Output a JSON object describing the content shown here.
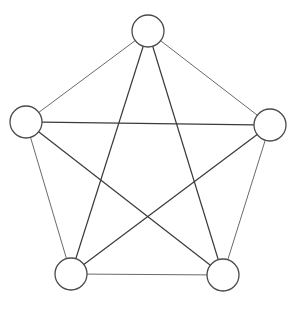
{
  "diagram": {
    "type": "complete-graph",
    "name": "K5",
    "node_radius": 16,
    "colors": {
      "background": "#ffffff",
      "node_stroke": "#4a4a4a",
      "node_fill": "#ffffff",
      "outer_edge": "#6a6a6a",
      "inner_edge": "#3a3a3a"
    },
    "nodes": [
      {
        "id": "top",
        "cx": 148,
        "cy": 31
      },
      {
        "id": "left",
        "cx": 26,
        "cy": 122
      },
      {
        "id": "right",
        "cx": 270,
        "cy": 125
      },
      {
        "id": "bottom-left",
        "cx": 71,
        "cy": 274
      },
      {
        "id": "bottom-right",
        "cx": 223,
        "cy": 275
      }
    ],
    "edges": [
      {
        "from": "top",
        "to": "left",
        "kind": "outer"
      },
      {
        "from": "top",
        "to": "right",
        "kind": "outer"
      },
      {
        "from": "left",
        "to": "bottom-left",
        "kind": "outer"
      },
      {
        "from": "right",
        "to": "bottom-right",
        "kind": "outer"
      },
      {
        "from": "bottom-left",
        "to": "bottom-right",
        "kind": "outer"
      },
      {
        "from": "top",
        "to": "bottom-left",
        "kind": "inner"
      },
      {
        "from": "top",
        "to": "bottom-right",
        "kind": "inner"
      },
      {
        "from": "left",
        "to": "right",
        "kind": "inner"
      },
      {
        "from": "left",
        "to": "bottom-right",
        "kind": "inner"
      },
      {
        "from": "right",
        "to": "bottom-left",
        "kind": "inner"
      }
    ]
  }
}
